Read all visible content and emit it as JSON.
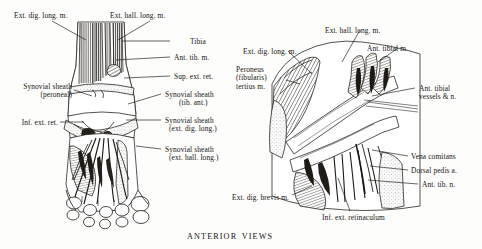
{
  "plate": {
    "caption": "ANTERIOR VIEWS",
    "background_color": "#fdfdfb",
    "ink_color": "#1b1b1b"
  },
  "figures": [
    {
      "id": "left-figure",
      "name": "dorsum-of-foot-superficial-dissection",
      "labels": [
        {
          "id": "ext-dig-long-m",
          "text": "Ext. dig. long. m.",
          "sub": null,
          "align": "left",
          "x": 14,
          "y": 12
        },
        {
          "id": "ext-hall-long-m",
          "text": "Ext. hall. long. m.",
          "sub": null,
          "align": "left",
          "x": 110,
          "y": 12
        },
        {
          "id": "tibia",
          "text": "Tibia",
          "sub": null,
          "align": "left",
          "x": 172,
          "y": 38
        },
        {
          "id": "ant-tib-m",
          "text": "Ant. tib. m.",
          "sub": null,
          "align": "left",
          "x": 172,
          "y": 54
        },
        {
          "id": "sup-ext-ret",
          "text": "Sup. ext. ret.",
          "sub": null,
          "align": "left",
          "x": 172,
          "y": 73
        },
        {
          "id": "synovial-sheath-peroneal",
          "text": "Synovial sheath",
          "sub": "(peroneal)",
          "align": "right",
          "x": 10,
          "y": 83
        },
        {
          "id": "inf-ext-ret",
          "text": "Inf. ext. ret.",
          "sub": null,
          "align": "right",
          "x": 10,
          "y": 119
        },
        {
          "id": "synovial-sheath-tib-ant",
          "text": "Synovial sheath",
          "sub": "(tib. ant.)",
          "align": "left",
          "x": 163,
          "y": 91
        },
        {
          "id": "synovial-sheath-ext-dig",
          "text": "Synovial sheath",
          "sub": "(ext. dig. long.)",
          "align": "left",
          "x": 163,
          "y": 117
        },
        {
          "id": "synovial-sheath-ext-hall",
          "text": "Synovial sheath",
          "sub": "(ext. hall. long.)",
          "align": "left",
          "x": 163,
          "y": 146
        }
      ]
    },
    {
      "id": "right-figure",
      "name": "ankle-deep-dissection-anterior",
      "labels": [
        {
          "id": "ext-hall-long-m-r",
          "text": "Ext. hall. long. m.",
          "sub": null,
          "align": "left",
          "x": 325,
          "y": 27
        },
        {
          "id": "ant-tibial-m",
          "text": "Ant. tibial m.",
          "sub": null,
          "align": "left",
          "x": 367,
          "y": 45
        },
        {
          "id": "ext-dig-long-m-r",
          "text": "Ext. dig. long. m.",
          "sub": null,
          "align": "left",
          "x": 243,
          "y": 48
        },
        {
          "id": "peroneus-tertius",
          "text": "Peroneus",
          "sub": "(fibularis)",
          "align": "right",
          "x": 236,
          "y": 66
        },
        {
          "id": "ant-tibial-vessels",
          "text": "Ant. tibial",
          "sub": "vessels & n.",
          "align": "left",
          "x": 417,
          "y": 85
        },
        {
          "id": "vena-comitans",
          "text": "Vena comitans",
          "sub": null,
          "align": "left",
          "x": 410,
          "y": 153
        },
        {
          "id": "dorsal-pedis-a",
          "text": "Dorsal pedis a.",
          "sub": null,
          "align": "left",
          "x": 410,
          "y": 167
        },
        {
          "id": "ant-tib-n",
          "text": "Ant. tib. n.",
          "sub": null,
          "align": "left",
          "x": 420,
          "y": 181
        },
        {
          "id": "ext-dig-brevis-m",
          "text": "Ext. dig. brevis m.",
          "sub": null,
          "align": "right",
          "x": 289,
          "y": 194
        },
        {
          "id": "inf-ext-retinaculum",
          "text": "Inf. ext. retinaculum",
          "sub": null,
          "align": "left",
          "x": 322,
          "y": 214
        }
      ],
      "peroneus_third_line": "tertius m."
    }
  ]
}
